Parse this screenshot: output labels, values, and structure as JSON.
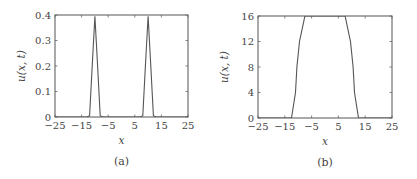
{
  "chart_data": [
    {
      "type": "line",
      "caption": "(a)",
      "xlabel": "x",
      "ylabel": "u(x, t)",
      "xlim": [
        -25,
        25
      ],
      "ylim": [
        0,
        0.4
      ],
      "xticks": [
        "-25",
        "-15",
        "-5",
        "5",
        "15",
        "25"
      ],
      "yticks": [
        "0",
        "0.1",
        "0.2",
        "0.3",
        "0.4"
      ],
      "grid": false,
      "series": [
        {
          "name": "u(x,t)",
          "x": [
            -25,
            -13,
            -12,
            -11,
            -10,
            -9,
            -8,
            -7,
            -6,
            6,
            7,
            8,
            9,
            10,
            11,
            12,
            13,
            25
          ],
          "y": [
            0,
            0,
            0.005,
            0.2,
            0.395,
            0.2,
            0.005,
            0,
            0,
            0,
            0,
            0.005,
            0.2,
            0.395,
            0.2,
            0.005,
            0,
            0
          ]
        }
      ],
      "frame": {
        "x": 55,
        "y": 15,
        "w": 133,
        "h": 102
      }
    },
    {
      "type": "line",
      "caption": "(b)",
      "xlabel": "x",
      "ylabel": "u(x, t)",
      "xlim": [
        -25,
        25
      ],
      "ylim": [
        0,
        16
      ],
      "xticks": [
        "-25",
        "-15",
        "-5",
        "5",
        "15",
        "25"
      ],
      "yticks": [
        "0",
        "4",
        "8",
        "12",
        "16"
      ],
      "grid": false,
      "series": [
        {
          "name": "u(x,t)",
          "x": [
            -25,
            -12.5,
            -11,
            -10.5,
            -9.5,
            -8.5,
            -7.5,
            7.5,
            8.5,
            9.5,
            10.5,
            11,
            12.5,
            25
          ],
          "y": [
            0,
            0,
            4,
            8,
            12,
            14,
            16,
            16,
            14,
            12,
            8,
            4,
            0,
            0
          ]
        }
      ],
      "frame": {
        "x": 258,
        "y": 16,
        "w": 134,
        "h": 102
      }
    }
  ]
}
